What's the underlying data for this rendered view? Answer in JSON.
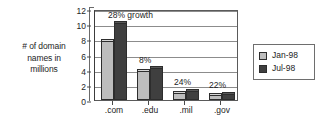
{
  "chart_data": {
    "type": "bar",
    "title": "",
    "xlabel": "",
    "ylabel": "# of domain names in millions",
    "ylim": [
      0,
      12
    ],
    "yticks": [
      0,
      2,
      4,
      6,
      8,
      10,
      12
    ],
    "grid": true,
    "legend_position": "right",
    "categories": [
      ".com",
      ".edu",
      ".mil",
      ".gov"
    ],
    "series": [
      {
        "name": "Jan-98",
        "color": "#bdbdbd",
        "values": [
          7.8,
          3.8,
          0.9,
          0.6
        ]
      },
      {
        "name": "Jul-98",
        "color": "#3f3f3f",
        "values": [
          10.2,
          4.2,
          1.2,
          0.85
        ]
      }
    ],
    "annotations": [
      {
        "text": "28% growth",
        "category": ".com"
      },
      {
        "text": "8%",
        "category": ".edu"
      },
      {
        "text": "24%",
        "category": ".mil"
      },
      {
        "text": "22%",
        "category": ".gov"
      }
    ]
  },
  "axis": {
    "y_title_lines": [
      "# of domain",
      "names in",
      "millions"
    ],
    "y_tick_labels": [
      "12",
      "10",
      "8",
      "6",
      "4",
      "2",
      "0"
    ],
    "x_tick_labels": [
      ".com",
      ".edu",
      ".mil",
      ".gov"
    ]
  },
  "annotations": {
    "com": "28% growth",
    "edu": "8%",
    "mil": "24%",
    "gov": "22%"
  },
  "legend": {
    "items": [
      {
        "label": "Jan-98",
        "color": "#bdbdbd"
      },
      {
        "label": "Jul-98",
        "color": "#3f3f3f"
      }
    ]
  }
}
